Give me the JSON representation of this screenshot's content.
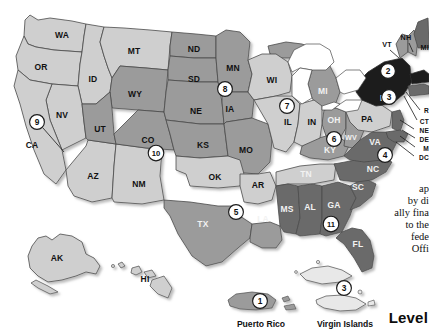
{
  "map": {
    "title_visible": false,
    "states": [
      {
        "ab": "WA",
        "x": 62,
        "y": 36,
        "shade": "light"
      },
      {
        "ab": "OR",
        "x": 41,
        "y": 68,
        "shade": "light"
      },
      {
        "ab": "ID",
        "x": 93,
        "y": 80,
        "shade": "light"
      },
      {
        "ab": "MT",
        "x": 134,
        "y": 52,
        "shade": "light"
      },
      {
        "ab": "ND",
        "x": 194,
        "y": 50,
        "shade": "mid"
      },
      {
        "ab": "SD",
        "x": 194,
        "y": 80,
        "shade": "mid"
      },
      {
        "ab": "NE",
        "x": 196,
        "y": 112,
        "shade": "mid"
      },
      {
        "ab": "KS",
        "x": 203,
        "y": 146,
        "shade": "mid"
      },
      {
        "ab": "MN",
        "x": 233,
        "y": 69,
        "shade": "mid"
      },
      {
        "ab": "IA",
        "x": 230,
        "y": 110,
        "shade": "mid"
      },
      {
        "ab": "MO",
        "x": 246,
        "y": 151,
        "shade": "mid"
      },
      {
        "ab": "WI",
        "x": 272,
        "y": 81,
        "shade": "light"
      },
      {
        "ab": "IL",
        "x": 288,
        "y": 123,
        "shade": "light"
      },
      {
        "ab": "IN",
        "x": 312,
        "y": 123,
        "shade": "light"
      },
      {
        "ab": "MI",
        "x": 323,
        "y": 92,
        "shade": "mid"
      },
      {
        "ab": "OH",
        "x": 334,
        "y": 121,
        "shade": "mid"
      },
      {
        "ab": "WY",
        "x": 135,
        "y": 95,
        "shade": "mid"
      },
      {
        "ab": "NV",
        "x": 62,
        "y": 116,
        "shade": "light"
      },
      {
        "ab": "UT",
        "x": 100,
        "y": 130,
        "shade": "mid"
      },
      {
        "ab": "CO",
        "x": 148,
        "y": 141,
        "shade": "mid"
      },
      {
        "ab": "CA",
        "x": 32,
        "y": 146,
        "shade": "light"
      },
      {
        "ab": "AZ",
        "x": 93,
        "y": 177,
        "shade": "light"
      },
      {
        "ab": "NM",
        "x": 139,
        "y": 185,
        "shade": "light"
      },
      {
        "ab": "OK",
        "x": 215,
        "y": 178,
        "shade": "light"
      },
      {
        "ab": "AR",
        "x": 258,
        "y": 186,
        "shade": "light"
      },
      {
        "ab": "TX",
        "x": 203,
        "y": 225,
        "shade": "mid"
      },
      {
        "ab": "LA",
        "x": 263,
        "y": 220,
        "shade": "mid"
      },
      {
        "ab": "MS",
        "x": 287,
        "y": 210,
        "shade": "dark"
      },
      {
        "ab": "AL",
        "x": 310,
        "y": 208,
        "shade": "dark"
      },
      {
        "ab": "TN",
        "x": 306,
        "y": 175,
        "shade": "light"
      },
      {
        "ab": "KY",
        "x": 330,
        "y": 151,
        "shade": "mid"
      },
      {
        "ab": "WV",
        "x": 351,
        "y": 138,
        "shade": "mid"
      },
      {
        "ab": "VA",
        "x": 375,
        "y": 143,
        "shade": "dark"
      },
      {
        "ab": "NC",
        "x": 373,
        "y": 170,
        "shade": "dark"
      },
      {
        "ab": "SC",
        "x": 358,
        "y": 188,
        "shade": "dark"
      },
      {
        "ab": "GA",
        "x": 334,
        "y": 206,
        "shade": "dark"
      },
      {
        "ab": "FL",
        "x": 358,
        "y": 245,
        "shade": "dark"
      },
      {
        "ab": "PA",
        "x": 367,
        "y": 120,
        "shade": "light"
      },
      {
        "ab": "NY",
        "x": 386,
        "y": 99,
        "shade": "black"
      },
      {
        "ab": "VT",
        "x": 387,
        "y": 45,
        "shade": "none"
      },
      {
        "ab": "NH",
        "x": 406,
        "y": 38,
        "shade": "none"
      },
      {
        "ab": "AK",
        "x": 57,
        "y": 259,
        "shade": "light"
      },
      {
        "ab": "HI",
        "x": 145,
        "y": 280,
        "shade": "light"
      }
    ],
    "edge_labels": [
      {
        "text": "MI",
        "x": 425,
        "y": 48
      },
      {
        "text": "R",
        "x": 426,
        "y": 111
      },
      {
        "text": "CT",
        "x": 423,
        "y": 122
      },
      {
        "text": "NE",
        "x": 422,
        "y": 131
      },
      {
        "text": "DE",
        "x": 423,
        "y": 140
      },
      {
        "text": "M",
        "x": 423,
        "y": 149
      },
      {
        "text": "DC",
        "x": 422,
        "y": 158
      }
    ],
    "region_badges": [
      {
        "num": "1",
        "x": 260,
        "y": 301
      },
      {
        "num": "2",
        "x": 388,
        "y": 71
      },
      {
        "num": "3",
        "x": 344,
        "y": 288
      },
      {
        "num": "3",
        "x": 389,
        "y": 97
      },
      {
        "num": "4",
        "x": 385,
        "y": 155
      },
      {
        "num": "5",
        "x": 236,
        "y": 212
      },
      {
        "num": "6",
        "x": 334,
        "y": 139
      },
      {
        "num": "7",
        "x": 287,
        "y": 106
      },
      {
        "num": "8",
        "x": 225,
        "y": 89
      },
      {
        "num": "9",
        "x": 37,
        "y": 122
      },
      {
        "num": "10",
        "x": 156,
        "y": 153
      },
      {
        "num": "11",
        "x": 331,
        "y": 224
      }
    ],
    "territories": [
      {
        "name": "Puerto Rico",
        "x": 261,
        "y": 327
      },
      {
        "name": "Virgin Islands",
        "x": 345,
        "y": 327
      }
    ]
  },
  "sidepanel": {
    "lines": [
      "ap",
      "by di",
      "ally fina",
      "to the",
      "fede",
      "Offi"
    ],
    "heading": "Level"
  },
  "colors": {
    "light": "#cfcfcf",
    "mid": "#9b9b9b",
    "dark": "#6b6b6b",
    "black": "#1c1c1c",
    "outline": "#4a4a4a",
    "background": "#ffffff",
    "badge_fill": "#ffffff",
    "badge_stroke": "#1a1a1a"
  }
}
